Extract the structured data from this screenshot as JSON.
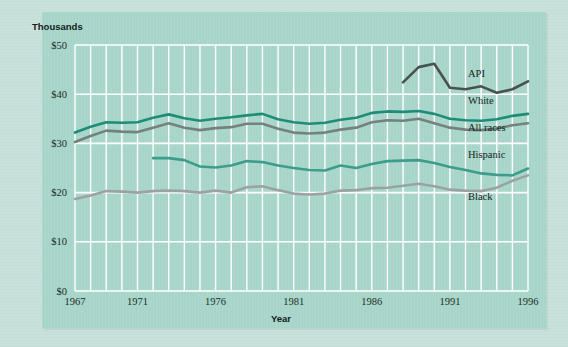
{
  "figure": {
    "background_color": "#c7e2da",
    "panel_color": "#a8d5c9",
    "grid_color": "#ffffff",
    "unit_label": "Thousands",
    "x_axis_title": "Year"
  },
  "chart_data": {
    "type": "line",
    "title": "",
    "subtitle": "",
    "xlabel": "Year",
    "ylabel": "Thousands",
    "grid": true,
    "legend_position": "right-inline",
    "xlim": [
      1967,
      1996
    ],
    "ylim": [
      0,
      50
    ],
    "y_ticks": [
      0,
      10,
      20,
      30,
      40,
      50
    ],
    "y_tick_labels": [
      "$0",
      "$10",
      "$20",
      "$30",
      "$40",
      "$50"
    ],
    "x_ticks": [
      1967,
      1971,
      1976,
      1981,
      1986,
      1991,
      1996
    ],
    "x_tick_labels": [
      "1967",
      "1971",
      "1976",
      "1981",
      "1986",
      "1991",
      "1996"
    ],
    "x_gridline_years": [
      1967,
      1968,
      1969,
      1970,
      1971,
      1972,
      1973,
      1974,
      1975,
      1976,
      1977,
      1978,
      1979,
      1980,
      1981,
      1982,
      1983,
      1984,
      1985,
      1986,
      1987,
      1988,
      1989,
      1990,
      1991,
      1992,
      1993,
      1994,
      1995,
      1996
    ],
    "series": [
      {
        "name": "API",
        "color": "#4a5250",
        "label_color": "#132521",
        "width": 2.6,
        "x": [
          1988,
          1989,
          1990,
          1991,
          1992,
          1993,
          1994,
          1995,
          1996
        ],
        "values": [
          42.4,
          45.5,
          46.2,
          41.3,
          41.0,
          41.6,
          40.3,
          41.0,
          42.6
        ]
      },
      {
        "name": "White",
        "color": "#1d8d78",
        "label_color": "#132521",
        "width": 2.6,
        "x": [
          1967,
          1968,
          1969,
          1970,
          1971,
          1972,
          1973,
          1974,
          1975,
          1976,
          1977,
          1978,
          1979,
          1980,
          1981,
          1982,
          1983,
          1984,
          1985,
          1986,
          1987,
          1988,
          1989,
          1990,
          1991,
          1992,
          1993,
          1994,
          1995,
          1996
        ],
        "values": [
          32.2,
          33.4,
          34.3,
          34.2,
          34.3,
          35.2,
          35.9,
          35.1,
          34.6,
          35.0,
          35.3,
          35.7,
          36.0,
          34.9,
          34.3,
          34.0,
          34.2,
          34.8,
          35.2,
          36.2,
          36.5,
          36.4,
          36.6,
          36.0,
          35.0,
          34.7,
          34.6,
          34.9,
          35.6,
          36.0
        ]
      },
      {
        "name": "All races",
        "color": "#75817e",
        "label_color": "#132521",
        "width": 2.6,
        "x": [
          1967,
          1968,
          1969,
          1970,
          1971,
          1972,
          1973,
          1974,
          1975,
          1976,
          1977,
          1978,
          1979,
          1980,
          1981,
          1982,
          1983,
          1984,
          1985,
          1986,
          1987,
          1988,
          1989,
          1990,
          1991,
          1992,
          1993,
          1994,
          1995,
          1996
        ],
        "values": [
          30.3,
          31.5,
          32.6,
          32.4,
          32.3,
          33.2,
          34.1,
          33.2,
          32.7,
          33.1,
          33.3,
          34.0,
          34.0,
          33.0,
          32.2,
          32.0,
          32.2,
          32.8,
          33.2,
          34.3,
          34.7,
          34.6,
          35.0,
          34.1,
          33.2,
          32.8,
          32.7,
          33.0,
          33.7,
          34.1
        ]
      },
      {
        "name": "Hispanic",
        "color": "#3c9d8b",
        "label_color": "#132521",
        "width": 2.6,
        "x": [
          1972,
          1973,
          1974,
          1975,
          1976,
          1977,
          1978,
          1979,
          1980,
          1981,
          1982,
          1983,
          1984,
          1985,
          1986,
          1987,
          1988,
          1989,
          1990,
          1991,
          1992,
          1993,
          1994,
          1995,
          1996
        ],
        "values": [
          27.0,
          27.0,
          26.6,
          25.3,
          25.1,
          25.5,
          26.4,
          26.2,
          25.5,
          25.0,
          24.6,
          24.5,
          25.5,
          25.0,
          25.8,
          26.4,
          26.5,
          26.6,
          26.0,
          25.2,
          24.6,
          23.9,
          23.6,
          23.5,
          24.9
        ]
      },
      {
        "name": "Black",
        "color": "#9aa3a1",
        "label_color": "#132521",
        "width": 2.6,
        "x": [
          1967,
          1968,
          1969,
          1970,
          1971,
          1972,
          1973,
          1974,
          1975,
          1976,
          1977,
          1978,
          1979,
          1980,
          1981,
          1982,
          1983,
          1984,
          1985,
          1986,
          1987,
          1988,
          1989,
          1990,
          1991,
          1992,
          1993,
          1994,
          1995,
          1996
        ],
        "values": [
          18.7,
          19.4,
          20.3,
          20.2,
          20.0,
          20.3,
          20.4,
          20.3,
          20.0,
          20.4,
          20.0,
          21.1,
          21.3,
          20.5,
          19.8,
          19.6,
          19.8,
          20.4,
          20.5,
          20.9,
          21.0,
          21.4,
          21.8,
          21.3,
          20.6,
          20.4,
          20.3,
          21.0,
          22.4,
          23.5
        ]
      }
    ],
    "inline_labels": [
      {
        "text": "API",
        "x_px": 468,
        "y_px": 77
      },
      {
        "text": "White",
        "x_px": 468,
        "y_px": 104
      },
      {
        "text": "All races",
        "x_px": 468,
        "y_px": 131
      },
      {
        "text": "Hispanic",
        "x_px": 468,
        "y_px": 158
      },
      {
        "text": "Black",
        "x_px": 468,
        "y_px": 200
      }
    ]
  }
}
